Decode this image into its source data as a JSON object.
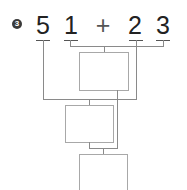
{
  "problem": {
    "number": "3",
    "tokens": [
      "5",
      "1",
      "+",
      "2",
      "3"
    ]
  },
  "boxes": [
    {
      "id": "box-1",
      "value": ""
    },
    {
      "id": "box-2",
      "value": ""
    },
    {
      "id": "box-3",
      "value": ""
    }
  ],
  "colors": {
    "badge": "#3a3a3a",
    "text": "#222222",
    "lines": "#8a8a8a",
    "box_border": "#a8a8a8"
  }
}
